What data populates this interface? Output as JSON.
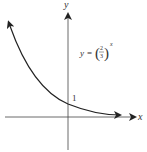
{
  "diagram": {
    "type": "exponential-decay-graph",
    "axes": {
      "x_label": "x",
      "y_label": "y"
    },
    "equation": {
      "lhs": "y",
      "equals": "=",
      "base_numerator": "2",
      "base_denominator": "3",
      "exponent": "x"
    },
    "y_intercept_label": "1",
    "colors": {
      "curve": "#222222",
      "axes": "#444444",
      "text": "#333333"
    }
  }
}
